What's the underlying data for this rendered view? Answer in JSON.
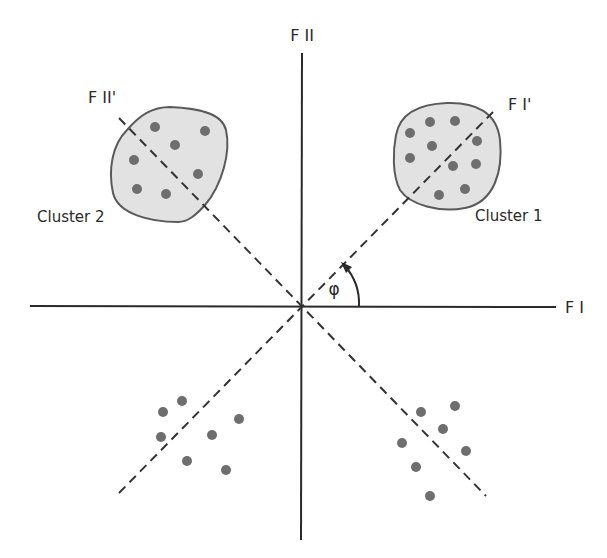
{
  "diagram": {
    "axis_labels": {
      "f1": "F I",
      "f2": "F II",
      "f1_rotated": "F I'",
      "f2_rotated": "F II'"
    },
    "angle_label": "φ",
    "clusters": [
      {
        "name": "Cluster 1",
        "enclosed": true,
        "point_count": 10
      },
      {
        "name": "Cluster 2",
        "enclosed": true,
        "point_count": 8
      }
    ],
    "unlabeled_groups": [
      {
        "quadrant": "lower-left",
        "point_count": 7
      },
      {
        "quadrant": "lower-right",
        "point_count": 7
      }
    ],
    "colors": {
      "axis": "#2a2a2a",
      "cluster_fill": "#e2e2e2",
      "cluster_outline": "#5a5a5a",
      "point": "#6e6e6e"
    }
  }
}
